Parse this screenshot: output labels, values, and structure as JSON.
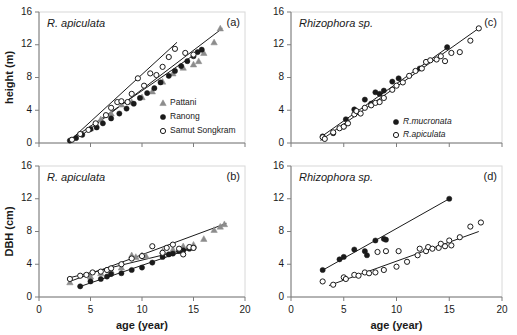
{
  "figure": {
    "width": 517,
    "height": 335,
    "background": "#ffffff",
    "axis_color": "#7d7d7d",
    "marker_colors": {
      "filled": "#1a1a1a",
      "open_stroke": "#1a1a1a",
      "open_fill": "#ffffff",
      "triangle": "#8c8c8c"
    }
  },
  "chart_data": [
    {
      "id": "panel-a",
      "type": "scatter",
      "tag": "(a)",
      "title": "R. apiculata",
      "xlabel": "",
      "ylabel": "height (m)",
      "xlim": [
        0,
        20
      ],
      "ylim": [
        0,
        16
      ],
      "xticks": [
        0,
        5,
        10,
        15,
        20
      ],
      "yticks": [
        0,
        4,
        8,
        12,
        16
      ],
      "xticklabels": [
        "",
        "",
        "",
        "",
        ""
      ],
      "yticklabels": [
        "0",
        "4",
        "8",
        "12",
        "16"
      ],
      "grid": false,
      "legend_position": "lower-right",
      "series": [
        {
          "name": "Pattani",
          "marker": "triangle",
          "color": "#8c8c8c",
          "points": [
            [
              5.0,
              1.8
            ],
            [
              6.0,
              2.9
            ],
            [
              7.0,
              3.6
            ],
            [
              8.0,
              4.7
            ],
            [
              9.0,
              5.0
            ],
            [
              10.0,
              5.6
            ],
            [
              11.0,
              6.3
            ],
            [
              12.0,
              7.5
            ],
            [
              13.0,
              8.5
            ],
            [
              14.0,
              9.2
            ],
            [
              15.0,
              9.6
            ],
            [
              15.5,
              10.0
            ],
            [
              16.0,
              11.0
            ],
            [
              17.0,
              12.3
            ],
            [
              17.6,
              14.0
            ]
          ]
        },
        {
          "name": "Ranong",
          "marker": "filled-circle",
          "color": "#1a1a1a",
          "points": [
            [
              3.0,
              0.3
            ],
            [
              3.6,
              0.6
            ],
            [
              4.2,
              1.0
            ],
            [
              5.0,
              1.7
            ],
            [
              5.6,
              1.9
            ],
            [
              6.2,
              2.4
            ],
            [
              7.0,
              3.0
            ],
            [
              7.8,
              3.6
            ],
            [
              8.5,
              4.2
            ],
            [
              9.2,
              4.8
            ],
            [
              9.8,
              5.5
            ],
            [
              10.5,
              6.1
            ],
            [
              11.2,
              6.7
            ],
            [
              11.8,
              7.4
            ],
            [
              12.6,
              8.2
            ],
            [
              13.2,
              8.8
            ],
            [
              13.8,
              9.4
            ],
            [
              14.4,
              10.0
            ],
            [
              15.0,
              10.6
            ],
            [
              15.4,
              11.1
            ],
            [
              15.8,
              11.4
            ]
          ]
        },
        {
          "name": "Samut Songkram",
          "marker": "open-circle",
          "color": "#1a1a1a",
          "points": [
            [
              3.2,
              0.4
            ],
            [
              4.0,
              1.1
            ],
            [
              4.8,
              1.6
            ],
            [
              5.5,
              2.4
            ],
            [
              6.5,
              3.4
            ],
            [
              7.0,
              4.3
            ],
            [
              7.6,
              5.0
            ],
            [
              8.0,
              5.1
            ],
            [
              8.6,
              5.0
            ],
            [
              9.0,
              6.0
            ],
            [
              9.6,
              7.9
            ],
            [
              10.2,
              7.0
            ],
            [
              10.8,
              8.5
            ],
            [
              11.4,
              8.3
            ],
            [
              12.0,
              9.3
            ],
            [
              12.6,
              10.5
            ],
            [
              13.2,
              11.5
            ],
            [
              14.2,
              11.0
            ],
            [
              15.0,
              10.8
            ]
          ]
        }
      ],
      "fits": [
        {
          "name": "fit-pattani",
          "x": [
            4.2,
            17.8
          ],
          "y": [
            1.0,
            14.0
          ]
        },
        {
          "name": "fit-ranong",
          "x": [
            2.8,
            15.9
          ],
          "y": [
            0.15,
            11.5
          ]
        },
        {
          "name": "fit-samut",
          "x": [
            3.0,
            13.4
          ],
          "y": [
            0.3,
            12.3
          ]
        }
      ]
    },
    {
      "id": "panel-b",
      "type": "scatter",
      "tag": "(b)",
      "title": "R. apiculata",
      "xlabel": "age (year)",
      "ylabel": "DBH (cm)",
      "xlim": [
        0,
        20
      ],
      "ylim": [
        0,
        16
      ],
      "xticks": [
        0,
        5,
        10,
        15,
        20
      ],
      "yticks": [
        0,
        4,
        8,
        12,
        16
      ],
      "xticklabels": [
        "0",
        "5",
        "10",
        "15",
        "20"
      ],
      "yticklabels": [
        "0",
        "4",
        "8",
        "12",
        "16"
      ],
      "grid": false,
      "legend_position": "none",
      "series": [
        {
          "name": "Pattani",
          "marker": "triangle",
          "color": "#8c8c8c",
          "points": [
            [
              3.0,
              1.8
            ],
            [
              5.0,
              2.5
            ],
            [
              6.0,
              2.9
            ],
            [
              7.0,
              3.2
            ],
            [
              8.0,
              3.6
            ],
            [
              9.0,
              5.1
            ],
            [
              9.4,
              4.9
            ],
            [
              10.0,
              5.1
            ],
            [
              10.4,
              5.0
            ],
            [
              12.0,
              5.6
            ],
            [
              13.0,
              5.8
            ],
            [
              14.0,
              6.2
            ],
            [
              15.0,
              6.4
            ],
            [
              16.0,
              7.1
            ],
            [
              17.0,
              8.2
            ],
            [
              17.6,
              8.6
            ],
            [
              18.0,
              8.9
            ]
          ]
        },
        {
          "name": "Ranong",
          "marker": "filled-circle",
          "color": "#1a1a1a",
          "points": [
            [
              4.0,
              1.3
            ],
            [
              5.0,
              1.9
            ],
            [
              6.0,
              2.2
            ],
            [
              6.6,
              2.5
            ],
            [
              7.0,
              2.8
            ],
            [
              8.0,
              2.9
            ],
            [
              9.0,
              3.3
            ],
            [
              10.0,
              3.6
            ],
            [
              11.0,
              4.2
            ],
            [
              12.0,
              4.9
            ],
            [
              12.6,
              5.2
            ],
            [
              13.0,
              5.3
            ],
            [
              13.6,
              5.6
            ],
            [
              14.0,
              5.7
            ],
            [
              14.6,
              5.9
            ],
            [
              15.0,
              6.0
            ]
          ]
        },
        {
          "name": "Samut Songkram",
          "marker": "open-circle",
          "color": "#1a1a1a",
          "points": [
            [
              3.0,
              2.2
            ],
            [
              4.0,
              2.6
            ],
            [
              4.6,
              2.7
            ],
            [
              5.2,
              3.0
            ],
            [
              6.0,
              3.1
            ],
            [
              6.6,
              3.3
            ],
            [
              7.0,
              3.5
            ],
            [
              8.0,
              4.0
            ],
            [
              9.0,
              4.7
            ],
            [
              10.0,
              5.0
            ],
            [
              11.0,
              6.2
            ],
            [
              12.0,
              5.4
            ],
            [
              12.4,
              6.0
            ],
            [
              13.0,
              6.4
            ],
            [
              13.6,
              5.9
            ],
            [
              14.0,
              5.2
            ],
            [
              14.6,
              6.1
            ],
            [
              15.0,
              6.0
            ]
          ]
        }
      ],
      "fits": [
        {
          "name": "fit-pattani",
          "x": [
            3.0,
            18.2
          ],
          "y": [
            1.9,
            9.0
          ]
        },
        {
          "name": "fit-ranong",
          "x": [
            3.8,
            15.2
          ],
          "y": [
            1.2,
            6.1
          ]
        },
        {
          "name": "fit-samut",
          "x": [
            2.8,
            15.2
          ],
          "y": [
            2.3,
            6.1
          ]
        }
      ]
    },
    {
      "id": "panel-c",
      "type": "scatter",
      "tag": "(c)",
      "title": "Rhizophora sp.",
      "xlabel": "",
      "ylabel": "",
      "xlim": [
        0,
        20
      ],
      "ylim": [
        0,
        16
      ],
      "xticks": [
        0,
        5,
        10,
        15,
        20
      ],
      "yticks": [
        0,
        4,
        8,
        12,
        16
      ],
      "xticklabels": [
        "",
        "",
        "",
        "",
        ""
      ],
      "yticklabels": [
        "0",
        "4",
        "8",
        "12",
        "16"
      ],
      "grid": false,
      "legend_position": "lower-right",
      "series": [
        {
          "name": "R.mucronata",
          "marker": "filled-circle",
          "color": "#1a1a1a",
          "points": [
            [
              3.0,
              0.8
            ],
            [
              4.0,
              1.2
            ],
            [
              5.0,
              2.0
            ],
            [
              5.2,
              2.9
            ],
            [
              6.0,
              4.1
            ],
            [
              6.2,
              3.8
            ],
            [
              7.0,
              5.3
            ],
            [
              7.6,
              4.8
            ],
            [
              8.0,
              6.2
            ],
            [
              8.4,
              6.0
            ],
            [
              8.8,
              6.4
            ],
            [
              9.6,
              7.5
            ],
            [
              10.2,
              7.9
            ],
            [
              12.2,
              9.1
            ],
            [
              14.8,
              11.7
            ]
          ]
        },
        {
          "name": "R.apiculata",
          "marker": "open-circle",
          "color": "#1a1a1a",
          "points": [
            [
              3.0,
              0.7
            ],
            [
              3.2,
              0.5
            ],
            [
              4.0,
              1.3
            ],
            [
              4.6,
              1.8
            ],
            [
              5.0,
              2.0
            ],
            [
              5.4,
              2.4
            ],
            [
              6.0,
              3.5
            ],
            [
              6.2,
              3.9
            ],
            [
              6.6,
              3.6
            ],
            [
              7.0,
              4.3
            ],
            [
              7.6,
              4.6
            ],
            [
              8.0,
              4.9
            ],
            [
              8.4,
              5.0
            ],
            [
              8.8,
              5.5
            ],
            [
              9.6,
              6.5
            ],
            [
              10.0,
              7.0
            ],
            [
              10.6,
              7.4
            ],
            [
              11.2,
              8.2
            ],
            [
              11.8,
              8.8
            ],
            [
              12.4,
              9.1
            ],
            [
              12.8,
              9.9
            ],
            [
              13.2,
              10.1
            ],
            [
              13.8,
              10.2
            ],
            [
              14.2,
              10.6
            ],
            [
              14.6,
              10.0
            ],
            [
              15.2,
              11.0
            ],
            [
              16.0,
              11.1
            ],
            [
              17.0,
              12.5
            ],
            [
              17.8,
              14.0
            ]
          ]
        }
      ],
      "fits": [
        {
          "name": "fit-mucronata",
          "x": [
            2.8,
            15.0
          ],
          "y": [
            0.7,
            11.8
          ]
        },
        {
          "name": "fit-apiculata",
          "x": [
            2.8,
            17.9
          ],
          "y": [
            0.3,
            14.1
          ]
        }
      ]
    },
    {
      "id": "panel-d",
      "type": "scatter",
      "tag": "(d)",
      "title": "Rhizophora sp.",
      "xlabel": "age (year)",
      "ylabel": "",
      "xlim": [
        0,
        20
      ],
      "ylim": [
        0,
        16
      ],
      "xticks": [
        0,
        5,
        10,
        15,
        20
      ],
      "yticks": [
        0,
        4,
        8,
        12,
        16
      ],
      "xticklabels": [
        "0",
        "5",
        "10",
        "15",
        "20"
      ],
      "yticklabels": [
        "0",
        "4",
        "8",
        "12",
        "16"
      ],
      "grid": false,
      "legend_position": "none",
      "series": [
        {
          "name": "R.mucronata",
          "marker": "filled-circle",
          "color": "#1a1a1a",
          "points": [
            [
              3.0,
              3.3
            ],
            [
              4.6,
              4.6
            ],
            [
              5.0,
              4.9
            ],
            [
              6.0,
              5.8
            ],
            [
              7.0,
              5.6
            ],
            [
              7.2,
              5.1
            ],
            [
              8.0,
              6.9
            ],
            [
              8.8,
              7.1
            ],
            [
              9.0,
              7.0
            ],
            [
              15.0,
              12.0
            ]
          ]
        },
        {
          "name": "R.apiculata",
          "marker": "open-circle",
          "color": "#1a1a1a",
          "points": [
            [
              3.0,
              1.9
            ],
            [
              4.0,
              1.5
            ],
            [
              5.0,
              2.4
            ],
            [
              5.2,
              2.2
            ],
            [
              6.0,
              2.7
            ],
            [
              6.4,
              2.6
            ],
            [
              7.0,
              3.0
            ],
            [
              7.4,
              2.9
            ],
            [
              8.0,
              3.0
            ],
            [
              8.2,
              5.5
            ],
            [
              8.8,
              3.3
            ],
            [
              9.0,
              5.6
            ],
            [
              10.0,
              3.7
            ],
            [
              10.2,
              5.6
            ],
            [
              11.0,
              4.3
            ],
            [
              12.0,
              5.1
            ],
            [
              12.2,
              5.9
            ],
            [
              12.8,
              5.6
            ],
            [
              13.0,
              6.1
            ],
            [
              13.4,
              5.9
            ],
            [
              14.0,
              6.0
            ],
            [
              14.2,
              6.5
            ],
            [
              14.6,
              6.2
            ],
            [
              15.0,
              6.9
            ],
            [
              15.2,
              6.3
            ],
            [
              16.0,
              7.3
            ],
            [
              17.0,
              8.6
            ],
            [
              18.0,
              9.1
            ]
          ]
        }
      ],
      "fits": [
        {
          "name": "fit-mucronata",
          "x": [
            2.9,
            15.0
          ],
          "y": [
            3.2,
            12.0
          ]
        },
        {
          "name": "fit-apiculata",
          "x": [
            3.6,
            17.8
          ],
          "y": [
            1.4,
            8.0
          ]
        }
      ]
    }
  ],
  "legends": {
    "panel_a": {
      "items": [
        {
          "label": "Pattani",
          "marker": "triangle"
        },
        {
          "label": "Ranong",
          "marker": "filled-circle"
        },
        {
          "label": "Samut Songkram",
          "marker": "open-circle"
        }
      ]
    },
    "panel_c": {
      "items": [
        {
          "label": "R.mucronata",
          "marker": "filled-circle"
        },
        {
          "label": "R.apiculata",
          "marker": "open-circle"
        }
      ]
    }
  }
}
